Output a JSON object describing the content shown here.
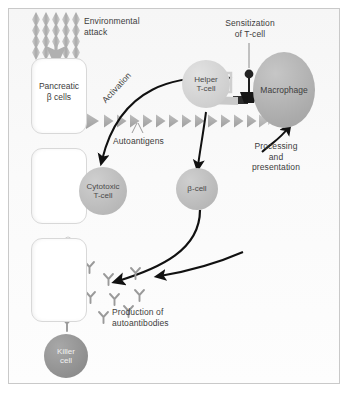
{
  "figure": {
    "background_color": "#fbfbfb",
    "frame_color": "#c9c9c9"
  },
  "labels": {
    "environmental_attack": "Environmental\nattack",
    "pancreatic_beta_cells": "Pancreatic\nβ cells",
    "activation": "Activation",
    "autoantigens": "Autoantigens",
    "sensitization_of_tcell": "Sensitization\nof T-cell",
    "helper_tcell": "Helper\nT-cell",
    "macrophage": "Macrophage",
    "processing_and_presentation": "Processing\nand\npresentation",
    "cytotoxic_tcell": "Cytotoxic\nT-cell",
    "beta_cell": "β-cell",
    "production_of_autoantibodies": "Production of\nautoantibodies",
    "killer_cell": "Killer\ncell"
  },
  "cells": {
    "pancreatic_boxes": [
      {
        "label": "Pancreatic\nβ cells",
        "has_label": true
      },
      {
        "label": "",
        "has_label": false
      },
      {
        "label": "",
        "has_label": false
      }
    ],
    "circles": [
      {
        "name": "helper-t-cell",
        "label": "Helper\nT-cell",
        "shade": "light"
      },
      {
        "name": "cytotoxic-t-cell",
        "label": "Cytotoxic\nT-cell",
        "shade": "mid"
      },
      {
        "name": "beta-cell",
        "label": "β-cell",
        "shade": "mid"
      },
      {
        "name": "killer-cell",
        "label": "Killer\ncell",
        "shade": "dark"
      }
    ],
    "macrophage": {
      "name": "macrophage",
      "label": "Macrophage"
    }
  },
  "elements": {
    "environmental_attack_diamonds": {
      "rows": 4,
      "columns": 5,
      "color": "#b9b9b9"
    },
    "autoantigen_triangles": {
      "count": 15,
      "color": "#a9a9a9"
    },
    "autoantibodies": {
      "count": 9,
      "shape": "Y",
      "color": "#9a9a9a"
    },
    "antigen_ball": {
      "color": "#2b2b2b"
    },
    "mhc_complex": {
      "color": "#1f1f1f"
    },
    "secretory_granules": {
      "clusters": 3,
      "color": "#d5d5d5"
    }
  },
  "arrows": {
    "environmental_attack_down": "down",
    "activation_curve": "curve-down-left",
    "cytotoxic_down": "down",
    "beta_cell_down": "down",
    "beta_cell_to_antibodies": "curve-down-left",
    "antibodies_inflow": "curve-left",
    "processing_up": "curve-up-right"
  },
  "colors": {
    "text": "#3c3c3c",
    "cell_fill": "#ffffff",
    "cell_stroke": "#d8d8d8",
    "arrow_dark": "#111111",
    "triangle": "#a9a9a9",
    "antibody": "#9a9a9a"
  }
}
